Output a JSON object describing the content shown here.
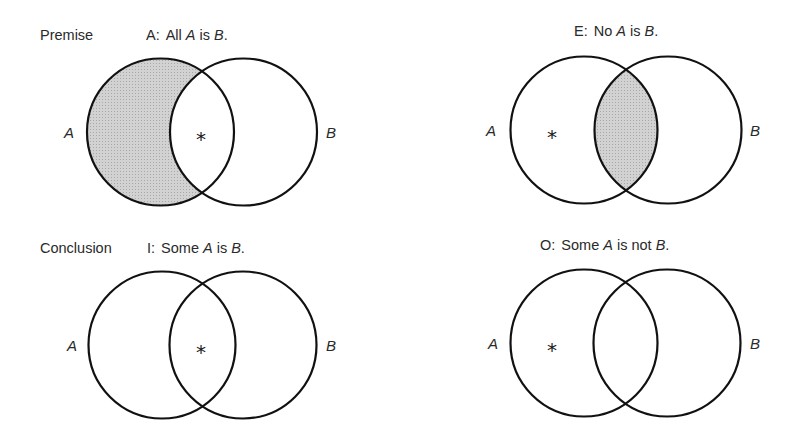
{
  "colors": {
    "ink": "#111111",
    "shade": "#c8c8c8",
    "background": "#ffffff"
  },
  "row_labels": {
    "premise": "Premise",
    "conclusion": "Conclusion"
  },
  "panels": [
    {
      "id": "A",
      "title_prefix": "A:",
      "title_parts": [
        "All ",
        "A",
        " is ",
        "B",
        "."
      ],
      "set_a": "A",
      "set_b": "B",
      "shaded_region": "A-only",
      "star_region": "A∩B",
      "star": "*"
    },
    {
      "id": "E",
      "title_prefix": "E:",
      "title_parts": [
        "No ",
        "A",
        " is ",
        "B",
        "."
      ],
      "set_a": "A",
      "set_b": "B",
      "shaded_region": "A∩B",
      "star_region": "A-only",
      "star": "*"
    },
    {
      "id": "I",
      "title_prefix": "I:",
      "title_parts": [
        "Some ",
        "A",
        " is ",
        "B",
        "."
      ],
      "set_a": "A",
      "set_b": "B",
      "shaded_region": "none",
      "star_region": "A∩B",
      "star": "*"
    },
    {
      "id": "O",
      "title_prefix": "O:",
      "title_parts": [
        "Some ",
        "A",
        " is not ",
        "B",
        "."
      ],
      "set_a": "A",
      "set_b": "B",
      "shaded_region": "none",
      "star_region": "A-only",
      "star": "*"
    }
  ]
}
